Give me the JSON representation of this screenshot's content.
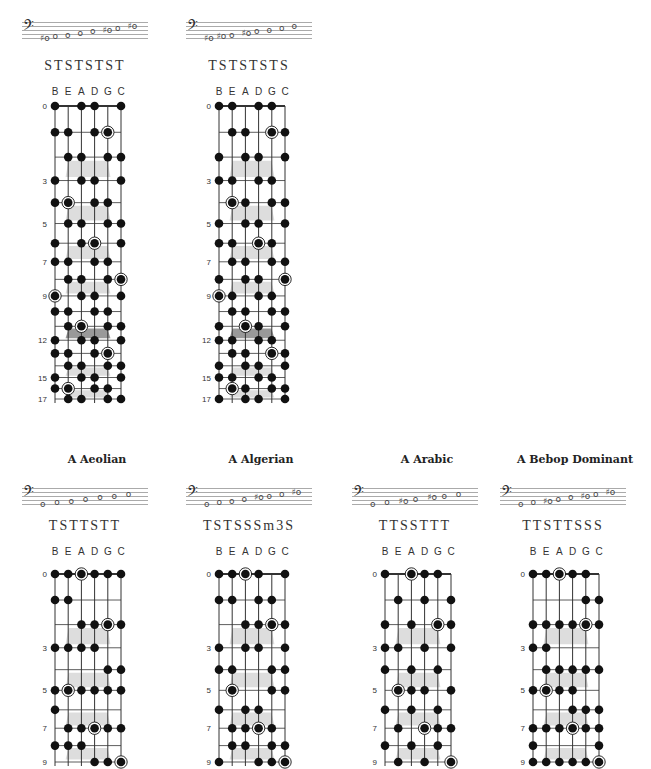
{
  "strings": [
    "B",
    "E",
    "A",
    "D",
    "G",
    "C"
  ],
  "colors": {
    "dot": "#111111",
    "line": "#333333",
    "marker": "#dddddd",
    "marker_12": "#999999",
    "staff_line": "#aaaaaa"
  },
  "panels": [
    {
      "id": "top-1",
      "title": "",
      "formula": "STSTSTST",
      "stave_notes": [
        "♯o",
        "o",
        "o",
        "o",
        "o",
        "♯o",
        "o",
        "♯o"
      ],
      "frets_shown": 17,
      "fret_labels": [
        0,
        3,
        5,
        7,
        9,
        12,
        15,
        17
      ],
      "dots": [
        [
          0,
          0
        ],
        [
          0,
          2
        ],
        [
          0,
          3
        ],
        [
          0,
          5
        ],
        [
          1,
          0
        ],
        [
          1,
          1
        ],
        [
          1,
          3
        ],
        [
          1,
          4,
          "root"
        ],
        [
          2,
          1
        ],
        [
          2,
          2
        ],
        [
          2,
          4
        ],
        [
          2,
          5
        ],
        [
          3,
          0
        ],
        [
          3,
          2
        ],
        [
          3,
          3
        ],
        [
          3,
          5
        ],
        [
          4,
          0
        ],
        [
          4,
          1,
          "root"
        ],
        [
          4,
          3
        ],
        [
          4,
          4
        ],
        [
          5,
          1
        ],
        [
          5,
          2
        ],
        [
          5,
          4
        ],
        [
          5,
          5
        ],
        [
          6,
          0
        ],
        [
          6,
          2
        ],
        [
          6,
          3,
          "root"
        ],
        [
          6,
          5
        ],
        [
          7,
          0
        ],
        [
          7,
          1
        ],
        [
          7,
          3
        ],
        [
          7,
          4
        ],
        [
          8,
          1
        ],
        [
          8,
          2
        ],
        [
          8,
          4
        ],
        [
          8,
          5,
          "root"
        ],
        [
          9,
          0,
          "root"
        ],
        [
          9,
          2
        ],
        [
          9,
          3
        ],
        [
          9,
          5
        ],
        [
          10,
          0
        ],
        [
          10,
          1
        ],
        [
          10,
          3
        ],
        [
          10,
          4
        ],
        [
          11,
          1
        ],
        [
          11,
          2,
          "root"
        ],
        [
          11,
          4
        ],
        [
          11,
          5
        ],
        [
          12,
          0
        ],
        [
          12,
          2
        ],
        [
          12,
          3
        ],
        [
          12,
          5
        ],
        [
          13,
          0
        ],
        [
          13,
          1
        ],
        [
          13,
          3
        ],
        [
          13,
          4,
          "root"
        ],
        [
          14,
          1
        ],
        [
          14,
          2
        ],
        [
          14,
          4
        ],
        [
          14,
          5
        ],
        [
          15,
          0
        ],
        [
          15,
          2
        ],
        [
          15,
          3
        ],
        [
          15,
          5
        ],
        [
          16,
          0
        ],
        [
          16,
          1,
          "root"
        ],
        [
          16,
          3
        ],
        [
          16,
          4
        ],
        [
          17,
          1
        ],
        [
          17,
          2
        ],
        [
          17,
          4
        ],
        [
          17,
          5
        ]
      ]
    },
    {
      "id": "top-2",
      "title": "",
      "formula": "TSTSTSTS",
      "stave_notes": [
        "♯o",
        "♯o",
        "o",
        "♯o",
        "o",
        "o",
        "o",
        "o"
      ],
      "frets_shown": 17,
      "fret_labels": [
        0,
        3,
        5,
        7,
        9,
        12,
        15,
        17
      ],
      "dots": [
        [
          0,
          0
        ],
        [
          0,
          1
        ],
        [
          0,
          3
        ],
        [
          0,
          4
        ],
        [
          1,
          1
        ],
        [
          1,
          2
        ],
        [
          1,
          4,
          "root"
        ],
        [
          1,
          5
        ],
        [
          2,
          0
        ],
        [
          2,
          2
        ],
        [
          2,
          3
        ],
        [
          2,
          5
        ],
        [
          3,
          0
        ],
        [
          3,
          1
        ],
        [
          3,
          3
        ],
        [
          3,
          4
        ],
        [
          4,
          1,
          "root"
        ],
        [
          4,
          2
        ],
        [
          4,
          4
        ],
        [
          4,
          5
        ],
        [
          5,
          0
        ],
        [
          5,
          2
        ],
        [
          5,
          3
        ],
        [
          5,
          5
        ],
        [
          6,
          0
        ],
        [
          6,
          1
        ],
        [
          6,
          3,
          "root"
        ],
        [
          6,
          4
        ],
        [
          7,
          1
        ],
        [
          7,
          2
        ],
        [
          7,
          4
        ],
        [
          7,
          5
        ],
        [
          8,
          0
        ],
        [
          8,
          2
        ],
        [
          8,
          3
        ],
        [
          8,
          5,
          "root"
        ],
        [
          9,
          0,
          "root"
        ],
        [
          9,
          1
        ],
        [
          9,
          3
        ],
        [
          9,
          4
        ],
        [
          10,
          1
        ],
        [
          10,
          2
        ],
        [
          10,
          4
        ],
        [
          10,
          5
        ],
        [
          11,
          0
        ],
        [
          11,
          2,
          "root"
        ],
        [
          11,
          3
        ],
        [
          11,
          5
        ],
        [
          12,
          0
        ],
        [
          12,
          1
        ],
        [
          12,
          3
        ],
        [
          12,
          4
        ],
        [
          13,
          1
        ],
        [
          13,
          2
        ],
        [
          13,
          4,
          "root"
        ],
        [
          13,
          5
        ],
        [
          14,
          0
        ],
        [
          14,
          2
        ],
        [
          14,
          3
        ],
        [
          14,
          5
        ],
        [
          15,
          0
        ],
        [
          15,
          1
        ],
        [
          15,
          3
        ],
        [
          15,
          4
        ],
        [
          16,
          1,
          "root"
        ],
        [
          16,
          2
        ],
        [
          16,
          4
        ],
        [
          16,
          5
        ],
        [
          17,
          0
        ],
        [
          17,
          2
        ],
        [
          17,
          3
        ],
        [
          17,
          5
        ]
      ]
    },
    {
      "id": "bottom-1",
      "title": "A Aeolian",
      "formula": "TSTTSTT",
      "stave_notes": [
        "o",
        "o",
        "o",
        "o",
        "o",
        "o",
        "o"
      ],
      "frets_shown": 9,
      "fret_labels": [
        0,
        3,
        5,
        7,
        9
      ],
      "dots": [
        [
          0,
          0
        ],
        [
          0,
          1
        ],
        [
          0,
          2,
          "root"
        ],
        [
          0,
          3
        ],
        [
          0,
          4
        ],
        [
          0,
          5
        ],
        [
          1,
          0
        ],
        [
          1,
          1
        ],
        [
          2,
          2
        ],
        [
          2,
          3
        ],
        [
          2,
          4,
          "root"
        ],
        [
          2,
          5
        ],
        [
          3,
          0
        ],
        [
          3,
          1
        ],
        [
          3,
          2
        ],
        [
          3,
          3
        ],
        [
          4,
          4
        ],
        [
          4,
          5
        ],
        [
          5,
          0
        ],
        [
          5,
          1,
          "root"
        ],
        [
          5,
          2
        ],
        [
          5,
          3
        ],
        [
          5,
          4
        ],
        [
          5,
          5
        ],
        [
          6,
          0
        ],
        [
          7,
          1
        ],
        [
          7,
          2
        ],
        [
          7,
          3,
          "root"
        ],
        [
          7,
          4
        ],
        [
          7,
          5
        ],
        [
          8,
          0
        ],
        [
          8,
          1
        ],
        [
          8,
          2
        ],
        [
          9,
          3
        ],
        [
          9,
          4
        ],
        [
          9,
          5,
          "root"
        ]
      ]
    },
    {
      "id": "bottom-2",
      "title": "A Algerian",
      "formula": "TSTSSSm3S",
      "stave_notes": [
        "o",
        "o",
        "o",
        "o",
        "♯o",
        "o",
        "o",
        "♯o"
      ],
      "frets_shown": 9,
      "fret_labels": [
        0,
        3,
        5,
        7,
        9
      ],
      "dots": [
        [
          0,
          0
        ],
        [
          0,
          1
        ],
        [
          0,
          2,
          "root"
        ],
        [
          0,
          3
        ],
        [
          0,
          5
        ],
        [
          1,
          0
        ],
        [
          1,
          1
        ],
        [
          1,
          3
        ],
        [
          1,
          4
        ],
        [
          2,
          2
        ],
        [
          2,
          3
        ],
        [
          2,
          4,
          "root"
        ],
        [
          2,
          5
        ],
        [
          3,
          0
        ],
        [
          3,
          2
        ],
        [
          3,
          3
        ],
        [
          3,
          5
        ],
        [
          4,
          0
        ],
        [
          4,
          1
        ],
        [
          4,
          4
        ],
        [
          4,
          5
        ],
        [
          5,
          1,
          "root"
        ],
        [
          5,
          4
        ],
        [
          5,
          5
        ],
        [
          6,
          0
        ],
        [
          6,
          2
        ],
        [
          6,
          3
        ],
        [
          7,
          1
        ],
        [
          7,
          2
        ],
        [
          7,
          3,
          "root"
        ],
        [
          7,
          4
        ],
        [
          8,
          1
        ],
        [
          8,
          2
        ],
        [
          8,
          4
        ],
        [
          8,
          5
        ],
        [
          9,
          0
        ],
        [
          9,
          3
        ],
        [
          9,
          4
        ],
        [
          9,
          5,
          "root"
        ]
      ]
    },
    {
      "id": "bottom-3",
      "title": "A Arabic",
      "formula": "TTSSTTT",
      "stave_notes": [
        "o",
        "o",
        "♯o",
        "o",
        "♯o",
        "o",
        "o"
      ],
      "frets_shown": 9,
      "fret_labels": [
        0,
        3,
        5,
        7,
        9
      ],
      "dots": [
        [
          0,
          0
        ],
        [
          0,
          2,
          "root"
        ],
        [
          0,
          3
        ],
        [
          0,
          4
        ],
        [
          1,
          1
        ],
        [
          1,
          3
        ],
        [
          1,
          5
        ],
        [
          2,
          0
        ],
        [
          2,
          2
        ],
        [
          2,
          4,
          "root"
        ],
        [
          2,
          5
        ],
        [
          3,
          0
        ],
        [
          3,
          1
        ],
        [
          3,
          3
        ],
        [
          3,
          5
        ],
        [
          4,
          0
        ],
        [
          4,
          2
        ],
        [
          4,
          4
        ],
        [
          5,
          1,
          "root"
        ],
        [
          5,
          2
        ],
        [
          5,
          3
        ],
        [
          5,
          5
        ],
        [
          6,
          0
        ],
        [
          6,
          2
        ],
        [
          6,
          4
        ],
        [
          7,
          1
        ],
        [
          7,
          3,
          "root"
        ],
        [
          7,
          4
        ],
        [
          7,
          5
        ],
        [
          8,
          0
        ],
        [
          8,
          2
        ],
        [
          8,
          4
        ],
        [
          9,
          1
        ],
        [
          9,
          3
        ],
        [
          9,
          5,
          "root"
        ]
      ]
    },
    {
      "id": "bottom-4",
      "title": "A Bebop Dominant",
      "formula": "TTSTTSSS",
      "stave_notes": [
        "o",
        "o",
        "♯o",
        "o",
        "o",
        "♯o",
        "o",
        "♯o"
      ],
      "frets_shown": 9,
      "fret_labels": [
        0,
        3,
        5,
        7,
        9
      ],
      "dots": [
        [
          0,
          0
        ],
        [
          0,
          1
        ],
        [
          0,
          2,
          "root"
        ],
        [
          0,
          3
        ],
        [
          0,
          4
        ],
        [
          1,
          4
        ],
        [
          1,
          5
        ],
        [
          2,
          0
        ],
        [
          2,
          1
        ],
        [
          2,
          2
        ],
        [
          2,
          3
        ],
        [
          2,
          4,
          "root"
        ],
        [
          2,
          5
        ],
        [
          3,
          0
        ],
        [
          3,
          1
        ],
        [
          4,
          1
        ],
        [
          4,
          2
        ],
        [
          4,
          3
        ],
        [
          4,
          4
        ],
        [
          4,
          5
        ],
        [
          5,
          0
        ],
        [
          5,
          1,
          "root"
        ],
        [
          5,
          2
        ],
        [
          5,
          3
        ],
        [
          6,
          3
        ],
        [
          6,
          4
        ],
        [
          6,
          5
        ],
        [
          7,
          0
        ],
        [
          7,
          1
        ],
        [
          7,
          2
        ],
        [
          7,
          3,
          "root"
        ],
        [
          7,
          4
        ],
        [
          7,
          5
        ],
        [
          8,
          0
        ],
        [
          8,
          5
        ],
        [
          9,
          0
        ],
        [
          9,
          1
        ],
        [
          9,
          2
        ],
        [
          9,
          3
        ],
        [
          9,
          4
        ],
        [
          9,
          5,
          "root"
        ]
      ]
    }
  ]
}
